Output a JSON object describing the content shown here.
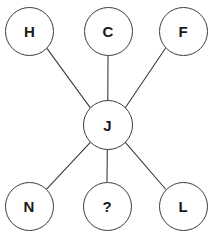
{
  "diagram": {
    "background_color": "#ffffff",
    "stroke_color": "#3b3b3b",
    "text_color": "#1a1a1a",
    "stroke_width": 1.1,
    "node_radius": 24.5,
    "center_node_radius": 25,
    "label_font_size": 15,
    "nodes": [
      {
        "id": "H",
        "label": "H",
        "cx": 29.5,
        "cy": 31.5,
        "r": 24.5,
        "role": "outer"
      },
      {
        "id": "C",
        "label": "C",
        "cx": 108,
        "cy": 31.5,
        "r": 24.5,
        "role": "outer"
      },
      {
        "id": "F",
        "label": "F",
        "cx": 183,
        "cy": 31.5,
        "r": 24.5,
        "role": "outer"
      },
      {
        "id": "J",
        "label": "J",
        "cx": 107.5,
        "cy": 125,
        "r": 25,
        "role": "center"
      },
      {
        "id": "N",
        "label": "N",
        "cx": 29,
        "cy": 206,
        "r": 24.5,
        "role": "outer"
      },
      {
        "id": "Q",
        "label": "?",
        "cx": 107,
        "cy": 206,
        "r": 24.5,
        "role": "outer"
      },
      {
        "id": "L",
        "label": "L",
        "cx": 183,
        "cy": 206,
        "r": 24.5,
        "role": "outer"
      }
    ],
    "edges": [
      {
        "from": "J",
        "to": "H",
        "x1": 90.0,
        "y1": 107.4,
        "x2": 47.1,
        "y2": 48.6
      },
      {
        "from": "J",
        "to": "C",
        "x1": 107.8,
        "y1": 100.0,
        "x2": 108.0,
        "y2": 56.0
      },
      {
        "from": "J",
        "to": "F",
        "x1": 125.3,
        "y1": 107.7,
        "x2": 165.3,
        "y2": 48.5
      },
      {
        "from": "J",
        "to": "N",
        "x1": 90.1,
        "y1": 142.6,
        "x2": 46.6,
        "y2": 189.2
      },
      {
        "from": "J",
        "to": "Q",
        "x1": 107.3,
        "y1": 150.0,
        "x2": 107.0,
        "y2": 181.5
      },
      {
        "from": "J",
        "to": "L",
        "x1": 125.3,
        "y1": 142.4,
        "x2": 165.5,
        "y2": 189.0
      }
    ]
  }
}
